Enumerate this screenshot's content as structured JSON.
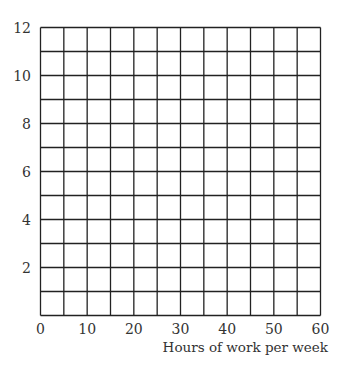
{
  "chart_data": {
    "type": "line",
    "title": "",
    "xlabel": "Hours of work per week",
    "ylabel": "",
    "xlim": [
      0,
      60
    ],
    "ylim": [
      0,
      12
    ],
    "x_ticks": [
      0,
      10,
      20,
      30,
      40,
      50,
      60
    ],
    "y_ticks": [
      2,
      4,
      6,
      8,
      10,
      12
    ],
    "grid": true,
    "grid_x_step": 5,
    "grid_y_step": 1,
    "series": [],
    "legend": null
  }
}
